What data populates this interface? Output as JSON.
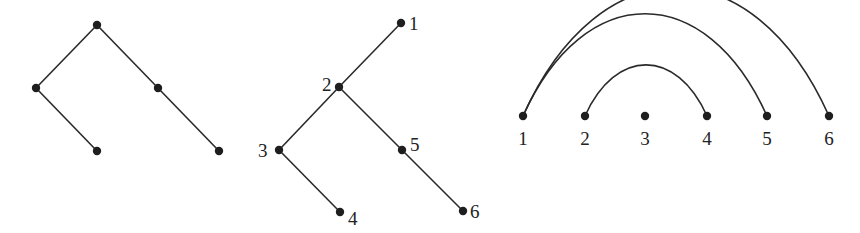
{
  "figure": {
    "panels": [
      {
        "id": "unlabeled-tree",
        "nodes": [
          {
            "id": "a",
            "x": 97,
            "y": 25
          },
          {
            "id": "b",
            "x": 36,
            "y": 88
          },
          {
            "id": "c",
            "x": 158,
            "y": 88
          },
          {
            "id": "d",
            "x": 97,
            "y": 151
          },
          {
            "id": "e",
            "x": 219,
            "y": 151
          }
        ],
        "edges": [
          [
            "a",
            "b"
          ],
          [
            "a",
            "c"
          ],
          [
            "b",
            "d"
          ],
          [
            "c",
            "e"
          ]
        ]
      },
      {
        "id": "labeled-tree",
        "nodes": [
          {
            "id": "1",
            "label": "1",
            "x": 401,
            "y": 23
          },
          {
            "id": "2",
            "label": "2",
            "x": 339,
            "y": 87
          },
          {
            "id": "3",
            "label": "3",
            "x": 279,
            "y": 150
          },
          {
            "id": "4",
            "label": "4",
            "x": 340,
            "y": 212
          },
          {
            "id": "5",
            "label": "5",
            "x": 402,
            "y": 150
          },
          {
            "id": "6",
            "label": "6",
            "x": 463,
            "y": 211
          }
        ],
        "edges": [
          [
            "1",
            "2"
          ],
          [
            "2",
            "3"
          ],
          [
            "3",
            "4"
          ],
          [
            "2",
            "5"
          ],
          [
            "5",
            "6"
          ]
        ]
      },
      {
        "id": "arc-diagram",
        "nodes": [
          {
            "id": "1",
            "label": "1",
            "x": 523,
            "y": 116
          },
          {
            "id": "2",
            "label": "2",
            "x": 585,
            "y": 116
          },
          {
            "id": "3",
            "label": "3",
            "x": 645,
            "y": 116
          },
          {
            "id": "4",
            "label": "4",
            "x": 707,
            "y": 116
          },
          {
            "id": "5",
            "label": "5",
            "x": 767,
            "y": 116
          },
          {
            "id": "6",
            "label": "6",
            "x": 829,
            "y": 116
          }
        ],
        "arcs": [
          [
            "1",
            "6"
          ],
          [
            "1",
            "5"
          ],
          [
            "2",
            "4"
          ]
        ]
      }
    ]
  }
}
